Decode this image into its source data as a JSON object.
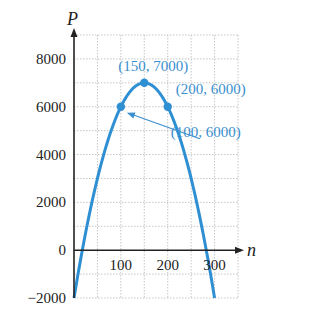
{
  "chart_data": {
    "type": "line",
    "title": "",
    "xlabel": "n",
    "ylabel": "P",
    "xlim": [
      0,
      350
    ],
    "ylim": [
      -2000,
      9000
    ],
    "grid": true,
    "x_ticks": [
      100,
      200,
      300
    ],
    "x_tick_labels": [
      "100",
      "200",
      "300"
    ],
    "y_ticks": [
      -2000,
      0,
      2000,
      4000,
      6000,
      8000
    ],
    "y_tick_labels": [
      "−2000",
      "0",
      "2000",
      "4000",
      "6000",
      "8000"
    ],
    "x_grid_step": 50,
    "y_grid_step": 1000,
    "series": [
      {
        "name": "P(n)",
        "equation": "P = -0.4n^2 + 120n - 2000",
        "coefficients": {
          "a": -0.4,
          "b": 120,
          "c": -2000
        },
        "x_range": [
          0,
          300
        ],
        "color": "#2f8fd3"
      }
    ],
    "points": [
      {
        "x": 100,
        "y": 6000,
        "label": "(100, 6000)"
      },
      {
        "x": 150,
        "y": 7000,
        "label": "(150, 7000)"
      },
      {
        "x": 200,
        "y": 6000,
        "label": "(200, 6000)"
      }
    ],
    "annotations": [
      {
        "text": "(150, 7000)",
        "anchor_point": 1,
        "placement": "above"
      },
      {
        "text": "(200, 6000)",
        "anchor_point": 2,
        "placement": "above-right"
      },
      {
        "text": "(100, 6000)",
        "anchor_point": 0,
        "placement": "lower-right",
        "arrow": true
      }
    ],
    "colors": {
      "curve": "#2f8fd3",
      "annotation": "#3a8fcf",
      "axis": "#222222",
      "grid": "#b8b8b8"
    }
  }
}
